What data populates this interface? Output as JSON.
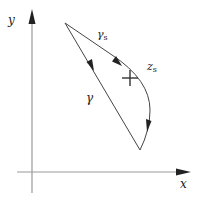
{
  "diagram": {
    "axes": {
      "x_label": "x",
      "y_label": "y"
    },
    "paths": [
      {
        "id": "gamma",
        "label": "γ",
        "kind": "straight-path",
        "direction": "start-to-end"
      },
      {
        "id": "gamma_s",
        "label_main": "γ",
        "label_sub": "s",
        "kind": "curved-path",
        "direction": "start-to-end"
      }
    ],
    "saddle_point": {
      "label_main": "z",
      "label_sub": "s",
      "marker": "cross"
    },
    "colors": {
      "axis": "#9a9a9a",
      "path": "#444444",
      "text": "#222222",
      "background": "#ffffff"
    }
  }
}
